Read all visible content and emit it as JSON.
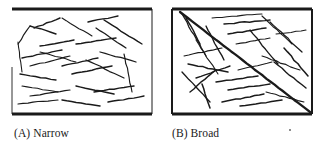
{
  "figure": {
    "name": "line-orientation-distribution-figure",
    "background_color": "#ffffff",
    "ink_color": "#1a1a1a",
    "panel_count": 2
  },
  "panels": [
    {
      "id": "a",
      "caption": "(A) Narrow",
      "label": "(A)",
      "title": "Narrow",
      "description": "Rectangular frame filled with scattered short line segments whose orientations cluster within a narrow angular range, mostly shallow and near-horizontal.",
      "frame": {
        "border_color": "#1a1a1a",
        "top_border_weight": 3,
        "bottom_border_weight": 3,
        "side_border_weight": 1,
        "left_border_visible": false
      },
      "segment_count": 26,
      "orientation_spread": "narrow"
    },
    {
      "id": "b",
      "caption": "(B) Broad",
      "label": "(B)",
      "title": "Broad",
      "description": "Rectangular frame filled with scattered line segments spanning a broad range of orientations, including one bold long diagonal crossing corner to corner.",
      "frame": {
        "border_color": "#1a1a1a",
        "top_border_weight": 3,
        "bottom_border_weight": 3,
        "side_border_weight": 2,
        "left_border_visible": true
      },
      "segment_count": 28,
      "orientation_spread": "broad"
    }
  ],
  "chart_data": {
    "type": "scatter",
    "title": "",
    "xlabel": "",
    "ylabel": "",
    "panel_a": {
      "label": "(A) Narrow",
      "orientation_spread_deg": 45,
      "segments": [
        {
          "x1": 18,
          "y1": 44,
          "x2": 30,
          "y2": 26
        },
        {
          "x1": 30,
          "y1": 26,
          "x2": 56,
          "y2": 34
        },
        {
          "x1": 34,
          "y1": 28,
          "x2": 60,
          "y2": 18
        },
        {
          "x1": 18,
          "y1": 42,
          "x2": 22,
          "y2": 72
        },
        {
          "x1": 40,
          "y1": 46,
          "x2": 74,
          "y2": 40
        },
        {
          "x1": 62,
          "y1": 18,
          "x2": 92,
          "y2": 36
        },
        {
          "x1": 40,
          "y1": 52,
          "x2": 76,
          "y2": 62
        },
        {
          "x1": 88,
          "y1": 22,
          "x2": 118,
          "y2": 16
        },
        {
          "x1": 96,
          "y1": 28,
          "x2": 126,
          "y2": 48
        },
        {
          "x1": 104,
          "y1": 20,
          "x2": 142,
          "y2": 44
        },
        {
          "x1": 76,
          "y1": 44,
          "x2": 116,
          "y2": 38
        },
        {
          "x1": 22,
          "y1": 58,
          "x2": 62,
          "y2": 50
        },
        {
          "x1": 30,
          "y1": 66,
          "x2": 70,
          "y2": 56
        },
        {
          "x1": 20,
          "y1": 74,
          "x2": 56,
          "y2": 80
        },
        {
          "x1": 62,
          "y1": 66,
          "x2": 98,
          "y2": 58
        },
        {
          "x1": 72,
          "y1": 74,
          "x2": 112,
          "y2": 66
        },
        {
          "x1": 86,
          "y1": 60,
          "x2": 124,
          "y2": 78
        },
        {
          "x1": 100,
          "y1": 52,
          "x2": 136,
          "y2": 62
        },
        {
          "x1": 124,
          "y1": 54,
          "x2": 132,
          "y2": 92
        },
        {
          "x1": 22,
          "y1": 86,
          "x2": 58,
          "y2": 92
        },
        {
          "x1": 30,
          "y1": 96,
          "x2": 70,
          "y2": 90
        },
        {
          "x1": 18,
          "y1": 104,
          "x2": 58,
          "y2": 100
        },
        {
          "x1": 62,
          "y1": 100,
          "x2": 100,
          "y2": 106
        },
        {
          "x1": 94,
          "y1": 92,
          "x2": 134,
          "y2": 86
        },
        {
          "x1": 76,
          "y1": 86,
          "x2": 114,
          "y2": 94
        },
        {
          "x1": 108,
          "y1": 102,
          "x2": 144,
          "y2": 96
        }
      ]
    },
    "panel_b": {
      "label": "(B) Broad",
      "orientation_spread_deg": 180,
      "segments": [
        {
          "x1": 14,
          "y1": 12,
          "x2": 144,
          "y2": 112,
          "weight": "bold"
        },
        {
          "x1": 16,
          "y1": 14,
          "x2": 40,
          "y2": 56
        },
        {
          "x1": 20,
          "y1": 18,
          "x2": 34,
          "y2": 44
        },
        {
          "x1": 30,
          "y1": 40,
          "x2": 52,
          "y2": 74
        },
        {
          "x1": 40,
          "y1": 26,
          "x2": 58,
          "y2": 60
        },
        {
          "x1": 46,
          "y1": 18,
          "x2": 96,
          "y2": 14
        },
        {
          "x1": 58,
          "y1": 24,
          "x2": 104,
          "y2": 20
        },
        {
          "x1": 62,
          "y1": 34,
          "x2": 100,
          "y2": 28
        },
        {
          "x1": 96,
          "y1": 16,
          "x2": 126,
          "y2": 44
        },
        {
          "x1": 104,
          "y1": 22,
          "x2": 136,
          "y2": 52
        },
        {
          "x1": 84,
          "y1": 30,
          "x2": 112,
          "y2": 64
        },
        {
          "x1": 70,
          "y1": 44,
          "x2": 104,
          "y2": 38
        },
        {
          "x1": 110,
          "y1": 34,
          "x2": 140,
          "y2": 30
        },
        {
          "x1": 18,
          "y1": 56,
          "x2": 56,
          "y2": 48
        },
        {
          "x1": 22,
          "y1": 64,
          "x2": 62,
          "y2": 72
        },
        {
          "x1": 30,
          "y1": 78,
          "x2": 64,
          "y2": 66
        },
        {
          "x1": 16,
          "y1": 72,
          "x2": 44,
          "y2": 102
        },
        {
          "x1": 36,
          "y1": 84,
          "x2": 44,
          "y2": 108
        },
        {
          "x1": 50,
          "y1": 82,
          "x2": 92,
          "y2": 76
        },
        {
          "x1": 62,
          "y1": 90,
          "x2": 104,
          "y2": 84
        },
        {
          "x1": 72,
          "y1": 70,
          "x2": 106,
          "y2": 62
        },
        {
          "x1": 96,
          "y1": 56,
          "x2": 134,
          "y2": 70
        },
        {
          "x1": 108,
          "y1": 62,
          "x2": 140,
          "y2": 88
        },
        {
          "x1": 118,
          "y1": 48,
          "x2": 142,
          "y2": 76
        },
        {
          "x1": 56,
          "y1": 102,
          "x2": 98,
          "y2": 94
        },
        {
          "x1": 74,
          "y1": 106,
          "x2": 116,
          "y2": 100
        },
        {
          "x1": 100,
          "y1": 92,
          "x2": 138,
          "y2": 102
        },
        {
          "x1": 24,
          "y1": 92,
          "x2": 50,
          "y2": 70
        }
      ]
    }
  }
}
